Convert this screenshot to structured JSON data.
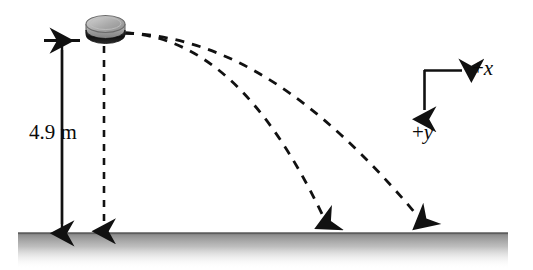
{
  "figure": {
    "background_color": "#ffffff",
    "ink_color": "#111111",
    "width": 533,
    "height": 270
  },
  "height_dimension": {
    "label": "4.9 m",
    "value": 4.9,
    "unit": "m",
    "arrow_style": "double-headed",
    "top_y": 40,
    "bottom_y": 233,
    "x": 62
  },
  "object": {
    "name": "puck",
    "description": "gray cylindrical puck shown in perspective with dark band",
    "center_x": 105,
    "center_y": 28,
    "body_color": "#8e8e8e",
    "band_color": "#1d1d1d",
    "top_color": "#b9b9b9"
  },
  "drop_path": {
    "name": "free-fall-drop-line",
    "style": "dashed",
    "from_x": 104,
    "from_y": 46,
    "to_x": 104,
    "to_y": 231
  },
  "trajectories": [
    {
      "name": "trajectory-slow",
      "style": "dashed",
      "launch_x": 125,
      "launch_y": 33,
      "landing_x": 332,
      "landing_y": 231
    },
    {
      "name": "trajectory-fast",
      "style": "dashed",
      "launch_x": 125,
      "launch_y": 33,
      "landing_x": 424,
      "landing_y": 231
    }
  ],
  "axes": {
    "origin_x": 424,
    "origin_y": 70,
    "x_label": "+x",
    "x_sign": "+",
    "x_symbol": "x",
    "y_label": "+y",
    "y_sign": "+",
    "y_symbol": "y",
    "x_direction": "right",
    "y_direction": "down"
  },
  "ground": {
    "name": "ground-line",
    "start_x": 18,
    "end_x": 508,
    "y": 233,
    "line_color": "#6f6f6f",
    "shadow_color": "#9a9a9a"
  }
}
